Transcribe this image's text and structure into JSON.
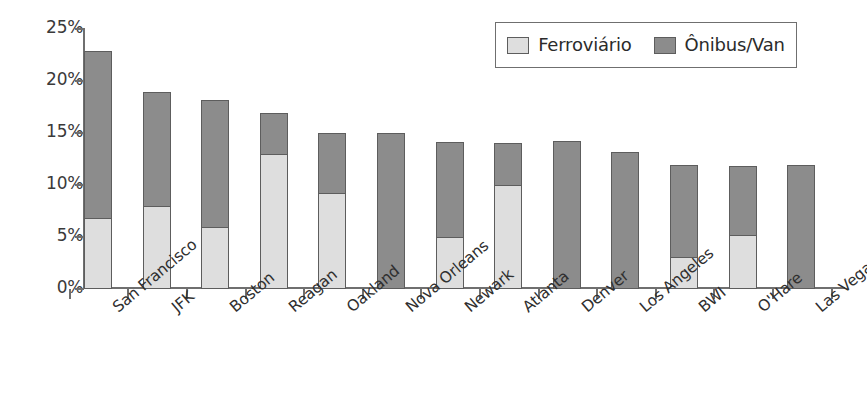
{
  "chart_data": {
    "type": "bar",
    "subtype": "stacked-vertical",
    "title": "",
    "xlabel": "",
    "ylabel": "",
    "ylim": [
      0,
      25
    ],
    "y_tick_values": [
      25,
      20,
      15,
      10,
      5,
      0
    ],
    "y_tick_labels": [
      "25%",
      "20%",
      "15%",
      "10%",
      "5%",
      "0%"
    ],
    "grid": false,
    "legend_position": "top-right",
    "categories": [
      "San Francisco",
      "JFK",
      "Boston",
      "Reagan",
      "Oakland",
      "Nova Orleans",
      "Newark",
      "Atlanta",
      "Denver",
      "Los Angeles",
      "BWI",
      "O'Hare",
      "Las Vegas"
    ],
    "series": [
      {
        "name": "Ferroviário",
        "color": "#dedede",
        "values": [
          6.8,
          8.0,
          6.0,
          13.0,
          9.2,
          0.0,
          5.0,
          10.0,
          0.0,
          0.0,
          3.1,
          5.2,
          0.0
        ]
      },
      {
        "name": "Ônibus/Van",
        "color": "#8c8c8c",
        "values": [
          16.2,
          11.0,
          12.3,
          4.0,
          5.9,
          15.0,
          9.2,
          4.1,
          14.2,
          13.2,
          8.9,
          6.7,
          11.9
        ]
      }
    ],
    "totals": [
      23.0,
      19.0,
      18.3,
      17.0,
      15.1,
      15.0,
      14.2,
      14.1,
      14.2,
      13.2,
      12.0,
      11.9,
      11.9
    ]
  },
  "legend": {
    "entries": [
      {
        "label": "Ferroviário",
        "swatch_color": "#dedede"
      },
      {
        "label": "Ônibus/Van",
        "swatch_color": "#8c8c8c"
      }
    ]
  },
  "axis_colors": {
    "axis_line": "#6f6f6f",
    "bar_border": "#5d5d5d",
    "text": "#2f2f2f"
  }
}
